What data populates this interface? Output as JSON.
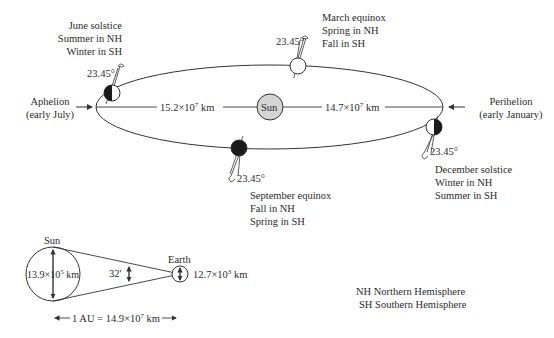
{
  "orbit": {
    "sun_label": "Sun",
    "aphelion": {
      "label": "Aphelion",
      "when": "(early July)",
      "distance": "15.2×10",
      "exp": "7",
      "unit": " km"
    },
    "perihelion": {
      "label": "Perihelion",
      "when": "(early January)",
      "distance": "14.7×10",
      "exp": "7",
      "unit": " km"
    },
    "tilt": "23.45°",
    "positions": [
      {
        "id": "june",
        "title": "June solstice",
        "line1": "Summer in NH",
        "line2": "Winter in SH"
      },
      {
        "id": "march",
        "title": "March equinox",
        "line1": "Spring in NH",
        "line2": "Fall in SH"
      },
      {
        "id": "september",
        "title": "September equinox",
        "line1": "Fall in NH",
        "line2": "Spring in SH"
      },
      {
        "id": "december",
        "title": "December solstice",
        "line1": "Winter in NH",
        "line2": "Summer in SH"
      }
    ]
  },
  "scale": {
    "sun_label": "Sun",
    "sun_diameter": "13.9×10",
    "sun_exp": "5",
    "sun_unit": " km",
    "angle": "32'",
    "earth_label": "Earth",
    "earth_diameter": "12.7×10",
    "earth_exp": "3",
    "earth_unit": " km",
    "au_prefix": "1 AU = 14.9×10",
    "au_exp": "7",
    "au_unit": " km"
  },
  "legend": [
    "NH Northern Hemisphere",
    "SH Southern Hemisphere"
  ],
  "colors": {
    "line": "#333333",
    "sun_fill": "#d4d4d4",
    "dark": "#1a1a1a"
  }
}
